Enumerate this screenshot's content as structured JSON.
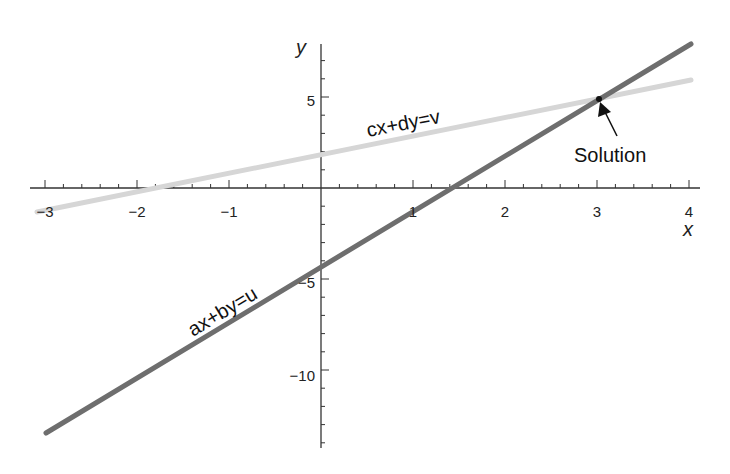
{
  "chart_data": {
    "type": "line",
    "title": "",
    "xlabel": "x",
    "ylabel": "y",
    "xlim": [
      -3.1,
      4.1
    ],
    "ylim": [
      -13.7,
      7.8
    ],
    "grid": false,
    "x_ticks": [
      -3,
      -2,
      -1,
      1,
      2,
      3,
      4
    ],
    "y_ticks": [
      -10,
      -5,
      5
    ],
    "x_tick_labels": [
      "−3",
      "−2",
      "−1",
      "1",
      "2",
      "3",
      "4"
    ],
    "y_tick_labels": [
      "−10",
      "−5",
      "5"
    ],
    "series": [
      {
        "name": "ax+by=u",
        "color": "#6e6e6e",
        "x": [
          -3,
          4
        ],
        "y": [
          -13.5,
          7.8
        ],
        "label": "ax+by=u"
      },
      {
        "name": "cx+dy=v",
        "color": "#d4d4d4",
        "x": [
          -3,
          4
        ],
        "y": [
          -1.3,
          6.0
        ],
        "label": "cx+dy=v"
      }
    ],
    "annotations": [
      {
        "text": "Solution",
        "point": [
          3,
          5
        ],
        "arrow": true
      }
    ]
  },
  "labels": {
    "x_axis": "x",
    "y_axis": "y",
    "line1": "ax+by=u",
    "line2": "cx+dy=v",
    "solution": "Solution",
    "xt_m3": "−3",
    "xt_m2": "−2",
    "xt_m1": "−1",
    "xt_1": "1",
    "xt_2": "2",
    "xt_3": "3",
    "xt_4": "4",
    "yt_5": "5",
    "yt_m5": "−5",
    "yt_m10": "−10"
  }
}
